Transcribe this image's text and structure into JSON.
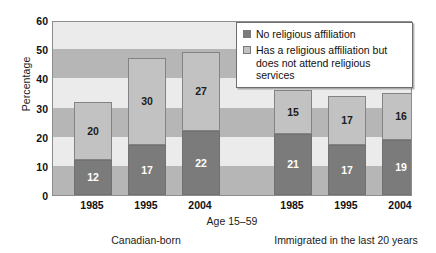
{
  "chart_data": {
    "type": "bar",
    "subtype": "stacked-bar",
    "title": "",
    "xlabel": "Age 15–59",
    "ylabel": "Percentage",
    "ylim": [
      0,
      60
    ],
    "ytick_step": 10,
    "ytick_labels": [
      "0",
      "10",
      "20",
      "30",
      "40",
      "50",
      "60"
    ],
    "grid": "horizontal-alternating-bands",
    "legend_position": "top-right-inside",
    "categories": [
      "1985",
      "1995",
      "2004",
      "1985",
      "1995",
      "2004"
    ],
    "groups": [
      {
        "label": "Canadian-born",
        "categories": [
          "1985",
          "1995",
          "2004"
        ]
      },
      {
        "label": "Immigrated in the last 20 years",
        "categories": [
          "1985",
          "1995",
          "2004"
        ]
      }
    ],
    "series": [
      {
        "name": "No religious affiliation",
        "color": "#7b7b7b",
        "values": [
          12,
          17,
          22,
          21,
          17,
          19
        ]
      },
      {
        "name": "Has a religious affiliation but does not attend religious services",
        "color": "#c2c2c2",
        "values": [
          20,
          30,
          27,
          15,
          17,
          16
        ]
      }
    ],
    "totals": [
      32,
      47,
      49,
      36,
      34,
      35
    ]
  },
  "axes": {
    "y_title": "Percentage",
    "x_title": "Age 15–59",
    "y_ticks": [
      {
        "label": "60",
        "value": 60
      },
      {
        "label": "50",
        "value": 50
      },
      {
        "label": "40",
        "value": 40
      },
      {
        "label": "30",
        "value": 30
      },
      {
        "label": "20",
        "value": 20
      },
      {
        "label": "10",
        "value": 10
      },
      {
        "label": "0",
        "value": 0
      }
    ],
    "x_ticks": [
      {
        "label": "1985"
      },
      {
        "label": "1995"
      },
      {
        "label": "2004"
      },
      {
        "label": "1985"
      },
      {
        "label": "1995"
      },
      {
        "label": "2004"
      }
    ]
  },
  "group_labels": [
    {
      "label": "Canadian-born"
    },
    {
      "label": "Immigrated in the last 20 years"
    }
  ],
  "legend": {
    "items": [
      {
        "label": "No religious affiliation",
        "swatch": "#7b7b7b",
        "swatch_name": "legend-swatch-no-affiliation"
      },
      {
        "label": "Has a religious affiliation but does not attend religious services",
        "swatch": "#c2c2c2",
        "swatch_name": "legend-swatch-has-affiliation"
      }
    ]
  },
  "bars": [
    {
      "category": "1985",
      "group": "Canadian-born",
      "bottom": "12",
      "top": "20"
    },
    {
      "category": "1995",
      "group": "Canadian-born",
      "bottom": "17",
      "top": "30"
    },
    {
      "category": "2004",
      "group": "Canadian-born",
      "bottom": "22",
      "top": "27"
    },
    {
      "category": "1985",
      "group": "Immigrated in the last 20 years",
      "bottom": "21",
      "top": "15"
    },
    {
      "category": "1995",
      "group": "Immigrated in the last 20 years",
      "bottom": "17",
      "top": "17"
    },
    {
      "category": "2004",
      "group": "Immigrated in the last 20 years",
      "bottom": "19",
      "top": "16"
    }
  ],
  "colors": {
    "series_dark": "#7b7b7b",
    "series_light": "#c2c2c2",
    "band_light": "#ebebeb",
    "band_dark": "#b6b6b6",
    "axis_line": "#8d8d8d"
  }
}
